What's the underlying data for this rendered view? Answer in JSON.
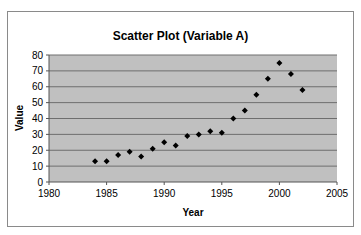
{
  "chart_data": {
    "type": "scatter",
    "title": "Scatter Plot (Variable A)",
    "xlabel": "Year",
    "ylabel": "Value",
    "xlim": [
      1980,
      2005
    ],
    "ylim": [
      0,
      80
    ],
    "x_ticks": [
      1980,
      1985,
      1990,
      1995,
      2000,
      2005
    ],
    "y_ticks": [
      0,
      10,
      20,
      30,
      40,
      50,
      60,
      70,
      80
    ],
    "grid": {
      "horizontal": true,
      "vertical": false
    },
    "legend": null,
    "marker": "diamond",
    "series": [
      {
        "name": "Variable A",
        "x": [
          1984,
          1985,
          1986,
          1987,
          1988,
          1989,
          1990,
          1991,
          1992,
          1993,
          1994,
          1995,
          1996,
          1997,
          1998,
          1999,
          2000,
          2001,
          2002
        ],
        "y": [
          13,
          13,
          17,
          19,
          16,
          21,
          25,
          23,
          29,
          30,
          32,
          31,
          40,
          45,
          55,
          65,
          75,
          68,
          58
        ]
      }
    ]
  },
  "colors": {
    "plot_background": "#c0c0c0",
    "gridline": "#6e6e6e",
    "marker": "#000000",
    "frame_border": "#8a8a8a"
  }
}
